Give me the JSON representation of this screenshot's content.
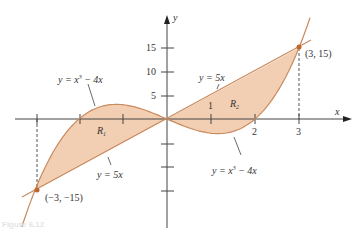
{
  "figure": {
    "caption": "Figure 6.12",
    "axes": {
      "x_label": "x",
      "y_label": "y",
      "x_ticks": [
        "1",
        "2",
        "3"
      ],
      "y_ticks": [
        "5",
        "10",
        "15"
      ]
    },
    "curves": [
      {
        "name": "cubic",
        "label_prefix": "y = x",
        "label_exp": "3",
        "label_suffix": " − 4x"
      },
      {
        "name": "line",
        "label": "y = 5x"
      }
    ],
    "regions": [
      {
        "name": "R",
        "sub": "1"
      },
      {
        "name": "R",
        "sub": "2"
      }
    ],
    "points": [
      {
        "label": "(3, 15)"
      },
      {
        "label": "(−3, −15)"
      }
    ],
    "colors": {
      "fill": "#f2cfb3",
      "curve": "#c98a5e",
      "point": "#c0672e",
      "axis": "#444444"
    }
  }
}
